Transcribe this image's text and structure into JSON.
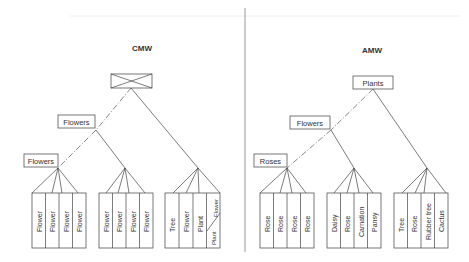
{
  "panels": [
    {
      "title": "CMW",
      "root": {
        "label": "",
        "icon": "crossed-box-icon"
      },
      "levels": [
        "Flowers",
        "Flowers"
      ],
      "groups": [
        {
          "leaves": [
            "Flower",
            "Flower",
            "Flower",
            "Flower"
          ]
        },
        {
          "leaves": [
            "Flower",
            "Flower",
            "Flower",
            "Flower"
          ]
        },
        {
          "leaves": [
            "Tree",
            "Flower",
            "Plant",
            "Plant / Flower"
          ],
          "split_last": [
            "Plant",
            "Flower"
          ]
        }
      ]
    },
    {
      "title": "AMW",
      "root": {
        "label": "Plants"
      },
      "levels": [
        "Flowers",
        "Roses"
      ],
      "groups": [
        {
          "leaves": [
            "Rose",
            "Rose",
            "Rose",
            "Rose"
          ]
        },
        {
          "leaves": [
            "Daisy",
            "Rose",
            "Carnation",
            "Pansy"
          ]
        },
        {
          "leaves": [
            "Tree",
            "Rose",
            "Rubber tree",
            "Cactus"
          ]
        }
      ]
    }
  ]
}
